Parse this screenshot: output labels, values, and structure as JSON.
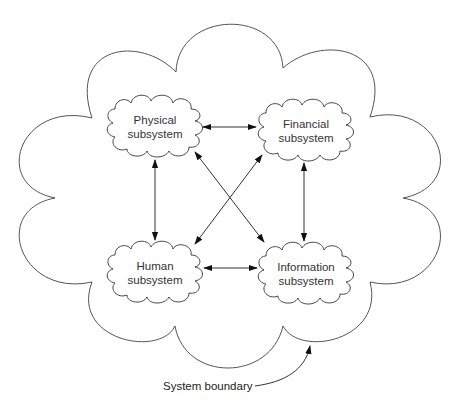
{
  "diagram": {
    "type": "system-subsystem cloud diagram",
    "boundary_label": "System boundary",
    "subsystems": [
      {
        "id": "physical",
        "line1": "Physical",
        "line2": "subsystem",
        "cx": 155,
        "cy": 127
      },
      {
        "id": "financial",
        "line1": "Financial",
        "line2": "subsystem",
        "cx": 306,
        "cy": 131
      },
      {
        "id": "human",
        "line1": "Human",
        "line2": "subsystem",
        "cx": 155,
        "cy": 273
      },
      {
        "id": "information",
        "line1": "Information",
        "line2": "subsystem",
        "cx": 306,
        "cy": 274
      }
    ],
    "connections": [
      {
        "from": "physical",
        "to": "financial",
        "direction": "bidirectional"
      },
      {
        "from": "physical",
        "to": "human",
        "direction": "bidirectional"
      },
      {
        "from": "physical",
        "to": "information",
        "direction": "bidirectional"
      },
      {
        "from": "financial",
        "to": "human",
        "direction": "bidirectional"
      },
      {
        "from": "financial",
        "to": "information",
        "direction": "bidirectional"
      },
      {
        "from": "human",
        "to": "information",
        "direction": "bidirectional"
      }
    ],
    "colors": {
      "line": "#333333",
      "background": "#ffffff",
      "text": "#333333"
    }
  }
}
